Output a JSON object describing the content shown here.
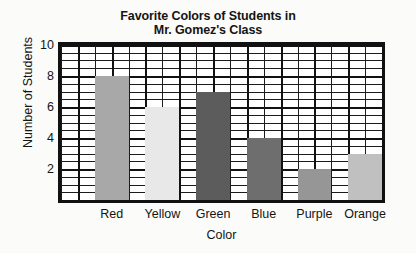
{
  "chart_data": {
    "type": "bar",
    "title": "Favorite Colors of Students in Mr. Gomez's Class",
    "title_lines": [
      "Favorite Colors of Students in",
      "Mr. Gomez's Class"
    ],
    "xlabel": "Color",
    "ylabel": "Number of Students",
    "categories": [
      "Red",
      "Yellow",
      "Green",
      "Blue",
      "Purple",
      "Orange"
    ],
    "values": [
      8,
      6,
      7,
      4,
      2,
      3
    ],
    "bar_colors": [
      "#a8a8a8",
      "#e8e8e8",
      "#5c5c5c",
      "#6e6e6e",
      "#969696",
      "#c0c0c0"
    ],
    "ylim": [
      0,
      10
    ],
    "ytick_labels": [
      "2",
      "4",
      "6",
      "8",
      "10"
    ],
    "ytick_values": [
      2,
      4,
      6,
      8,
      10
    ],
    "y_major_step": 2,
    "y_minor_step": 0.5,
    "grid": true,
    "grid_columns": 19,
    "legend": "none"
  },
  "style": {
    "paper_background": "#fbfbf9",
    "plot_background": "#ffffff",
    "axis_line_color": "#111111",
    "grid_line_color": "#1b1b1b",
    "text_color": "#141414"
  }
}
